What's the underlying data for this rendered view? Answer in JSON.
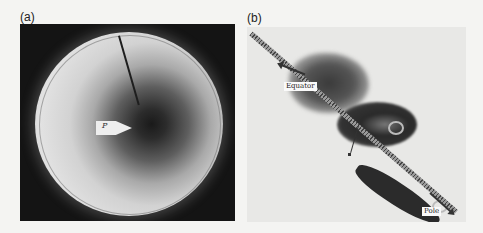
{
  "figure": {
    "panels": [
      {
        "label": "(a)",
        "description": "Rotating tank photograph viewed from above: bright circular fluid disk with dark central region, a rod reaching toward center, and a pointer marker",
        "pointer_label": "P"
      },
      {
        "label": "(b)",
        "description": "Side view of dye plume along a sloping hatched boundary, with eddies/swirls",
        "annotations": {
          "equator": "Equator",
          "pole": "Pole",
          "marker": "a"
        }
      }
    ],
    "colors": {
      "panel_a_background": "#141414",
      "panel_b_background": "#e8e8e6",
      "page_background": "#f4f4f2"
    }
  }
}
